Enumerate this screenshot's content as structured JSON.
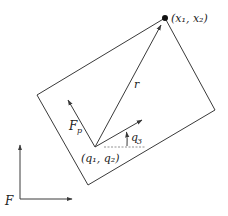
{
  "diagram": {
    "type": "planar rigid body kinematics",
    "colors": {
      "stroke": "#3a3a3a",
      "text": "#222222",
      "dashed": "#777777"
    },
    "labels": {
      "point": "(x₁, x₂)",
      "r": "r",
      "fp": "F",
      "fp_sub": "p",
      "origin": "(q₁, q₂)",
      "angle": "q",
      "angle_sub": "3",
      "frame": "F"
    },
    "geometry": {
      "body_rectangle": [
        [
          165,
          18
        ],
        [
          215,
          110
        ],
        [
          88,
          185
        ],
        [
          37,
          95
        ]
      ],
      "point_x": [
        165,
        18
      ],
      "origin_q": [
        95,
        147
      ],
      "r_tip": [
        161,
        25
      ],
      "fp_tip": [
        68,
        100
      ],
      "body_x_axis_tip": [
        142,
        120
      ],
      "frame_origin": [
        20,
        199
      ],
      "frame_y_tip": [
        20,
        145
      ],
      "frame_x_tip": [
        72,
        199
      ]
    }
  }
}
